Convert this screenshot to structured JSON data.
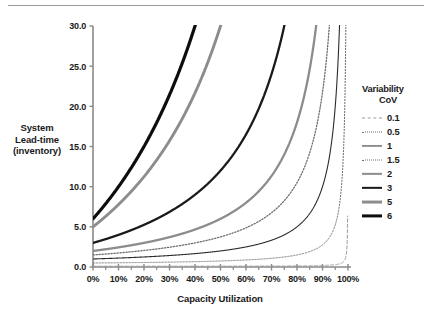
{
  "figure": {
    "y_axis_title": "System Lead-time (inventory)",
    "y_axis_title_lines": [
      "System",
      "Lead-time",
      "(inventory)"
    ],
    "x_axis_title": "Capacity Utilization"
  },
  "legend": {
    "title_line1": "Variability",
    "title_line2": "CoV",
    "entries": [
      {
        "label": "0.1",
        "color": "#9b9b9b",
        "width": 1.0,
        "dash": "3,2"
      },
      {
        "label": "0.5",
        "color": "#6f6f6f",
        "width": 1.0,
        "dash": "1.6,1.6"
      },
      {
        "label": "1",
        "color": "#2b2b2b",
        "width": 1.1,
        "dash": "none"
      },
      {
        "label": "1.5",
        "color": "#6f6f6f",
        "width": 1.3,
        "dash": "1.6,1.6"
      },
      {
        "label": "2",
        "color": "#8c8c8c",
        "width": 2.3,
        "dash": "none"
      },
      {
        "label": "3",
        "color": "#1a1a1a",
        "width": 2.3,
        "dash": "none"
      },
      {
        "label": "5",
        "color": "#8c8c8c",
        "width": 2.9,
        "dash": "none"
      },
      {
        "label": "6",
        "color": "#0d0d0d",
        "width": 3.2,
        "dash": "none"
      }
    ]
  },
  "chart_data": {
    "type": "line",
    "title": "",
    "xlabel": "Capacity Utilization",
    "ylabel": "System Lead-time (inventory)",
    "xlim": [
      0,
      100
    ],
    "ylim": [
      0,
      30
    ],
    "grid": false,
    "legend_position": "right",
    "x_tick_labels": [
      "0%",
      "10%",
      "20%",
      "30%",
      "40%",
      "50%",
      "60%",
      "70%",
      "80%",
      "90%",
      "100%"
    ],
    "x_ticks": [
      0,
      10,
      20,
      30,
      40,
      50,
      60,
      70,
      80,
      90,
      100
    ],
    "x_minor_ticks": [
      5,
      15,
      25,
      35,
      45,
      55,
      65,
      75,
      85,
      95
    ],
    "y_tick_labels": [
      "0.0",
      "5.0",
      "10.0",
      "15.0",
      "20.0",
      "25.0",
      "30.0"
    ],
    "y_ticks": [
      0,
      5,
      10,
      15,
      20,
      25,
      30
    ],
    "x": [
      0,
      5,
      10,
      15,
      20,
      25,
      30,
      35,
      40,
      45,
      50,
      55,
      60,
      65,
      70,
      75,
      80,
      85,
      90,
      92,
      94,
      95,
      96,
      97,
      98,
      99,
      99.5
    ],
    "series": [
      {
        "name": "0.1",
        "cov": 0.1,
        "color": "#9b9b9b",
        "style": "dashed",
        "width": 1.0,
        "values": [
          0.1,
          0.1,
          0.1,
          0.11,
          0.11,
          0.12,
          0.12,
          0.13,
          0.14,
          0.15,
          0.16,
          0.17,
          0.19,
          0.21,
          0.24,
          0.28,
          0.35,
          0.46,
          0.7,
          0.86,
          1.17,
          1.45,
          1.9,
          2.77,
          5.0,
          11.0,
          30.0
        ]
      },
      {
        "name": "0.5",
        "cov": 0.5,
        "color": "#6f6f6f",
        "style": "dotted",
        "width": 1.0,
        "values": [
          0.5,
          0.51,
          0.53,
          0.54,
          0.56,
          0.58,
          0.61,
          0.64,
          0.67,
          0.7,
          0.75,
          0.81,
          0.88,
          0.96,
          1.08,
          1.25,
          1.5,
          1.92,
          2.75,
          3.38,
          4.67,
          5.5,
          6.75,
          8.83,
          13.0,
          25.5,
          30.0
        ]
      },
      {
        "name": "1",
        "cov": 1.0,
        "color": "#2b2b2b",
        "style": "solid",
        "width": 1.1,
        "values": [
          1.0,
          1.05,
          1.11,
          1.18,
          1.25,
          1.33,
          1.43,
          1.54,
          1.67,
          1.82,
          2.0,
          2.22,
          2.5,
          2.86,
          3.33,
          4.0,
          5.0,
          6.67,
          10.0,
          12.5,
          16.7,
          20.0,
          25.0,
          30.0,
          30.0,
          30.0,
          30.0
        ]
      },
      {
        "name": "1.5",
        "cov": 1.5,
        "color": "#6f6f6f",
        "style": "dotted",
        "width": 1.3,
        "values": [
          1.5,
          1.62,
          1.75,
          1.9,
          2.06,
          2.25,
          2.46,
          2.71,
          3.0,
          3.34,
          3.75,
          4.25,
          4.88,
          5.68,
          6.75,
          8.25,
          10.5,
          14.3,
          22.0,
          27.6,
          30.0,
          30.0,
          30.0,
          30.0,
          30.0,
          30.0,
          30.0
        ]
      },
      {
        "name": "2",
        "cov": 2.0,
        "color": "#8c8c8c",
        "style": "solid",
        "width": 2.3,
        "values": [
          2.0,
          2.21,
          2.44,
          2.71,
          3.0,
          3.33,
          3.71,
          4.15,
          4.67,
          5.27,
          6.0,
          6.89,
          8.0,
          9.43,
          11.3,
          14.0,
          18.0,
          24.7,
          30.0,
          30.0,
          30.0,
          30.0,
          30.0,
          30.0,
          30.0,
          30.0,
          30.0
        ]
      },
      {
        "name": "3",
        "cov": 3.0,
        "color": "#1a1a1a",
        "style": "solid",
        "width": 2.3,
        "values": [
          3.0,
          3.47,
          4.0,
          4.59,
          5.25,
          6.0,
          6.86,
          7.85,
          9.0,
          10.4,
          12.0,
          14.0,
          16.5,
          19.7,
          24.0,
          30.0,
          30.0,
          30.0,
          30.0,
          30.0,
          30.0,
          30.0,
          30.0,
          30.0,
          30.0,
          30.0,
          30.0
        ]
      },
      {
        "name": "5",
        "cov": 5.0,
        "color": "#8c8c8c",
        "style": "solid",
        "width": 2.9,
        "values": [
          5.0,
          6.32,
          7.78,
          9.41,
          11.3,
          13.3,
          15.7,
          18.5,
          21.7,
          25.5,
          30.0,
          30.0,
          30.0,
          30.0,
          30.0,
          30.0,
          30.0,
          30.0,
          30.0,
          30.0,
          30.0,
          30.0,
          30.0,
          30.0,
          30.0,
          30.0,
          30.0
        ]
      },
      {
        "name": "6",
        "cov": 6.0,
        "color": "#0d0d0d",
        "style": "solid",
        "width": 3.2,
        "values": [
          6.0,
          7.89,
          10.0,
          12.4,
          15.0,
          18.0,
          21.4,
          25.4,
          30.0,
          30.0,
          30.0,
          30.0,
          30.0,
          30.0,
          30.0,
          30.0,
          30.0,
          30.0,
          30.0,
          30.0,
          30.0,
          30.0,
          30.0,
          30.0,
          30.0,
          30.0,
          30.0
        ]
      }
    ]
  }
}
